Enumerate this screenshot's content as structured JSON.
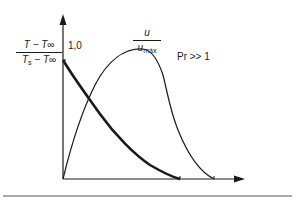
{
  "diagram": {
    "y_axis_label": {
      "numerator": "T − T∞",
      "denominator_main": "T",
      "denominator_sub": "s",
      "denominator_rest": " − T∞"
    },
    "y_tick": "1,0",
    "velocity_label": {
      "numerator": "u",
      "denominator_main": "u",
      "denominator_sub": "máx"
    },
    "condition": "Pr >> 1",
    "colors": {
      "stroke": "#1a1a1a",
      "background": "#ffffff"
    },
    "curves": [
      {
        "name": "temperature-profile",
        "style": "thick",
        "description": "Decreasing from 1,0 at wall to 0"
      },
      {
        "name": "velocity-profile",
        "style": "thin",
        "description": "Rises from 0 to peak then decays to 0"
      }
    ]
  }
}
